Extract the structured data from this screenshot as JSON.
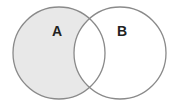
{
  "diagram": {
    "type": "venn",
    "shaded_region": "A minus B",
    "sets": [
      {
        "label": "A",
        "cx": 59,
        "cy": 53,
        "r": 46
      },
      {
        "label": "B",
        "cx": 120,
        "cy": 53,
        "r": 46
      }
    ],
    "colors": {
      "fill": "#e8e8e8",
      "stroke": "#8a8a8a",
      "background": "#ffffff"
    }
  }
}
